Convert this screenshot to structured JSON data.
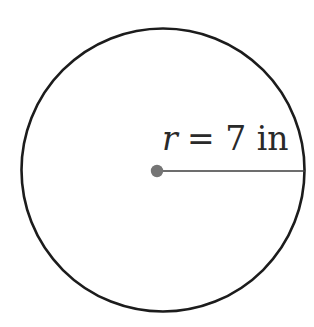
{
  "diagram": {
    "type": "geometry-circle-radius",
    "radius_label": {
      "variable": "r",
      "equation_rest": "= 7 in",
      "full_text": "r = 7 in",
      "value": "7",
      "unit": "in"
    },
    "colors": {
      "circle_stroke": "#1c1c1c",
      "radius_line": "#3c3c3c",
      "center_dot": "#757575",
      "background": "#ffffff",
      "label_text": "#2a2a2a"
    }
  }
}
